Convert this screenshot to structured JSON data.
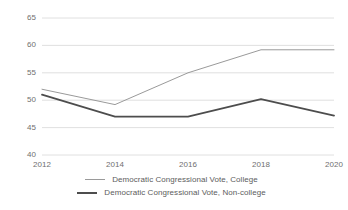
{
  "chart_data": {
    "type": "line",
    "title": "",
    "subtitle": "",
    "xlabel": "",
    "ylabel": "",
    "categories": [
      "2012",
      "2014",
      "2016",
      "2018",
      "2020"
    ],
    "x": [
      2012,
      2014,
      2016,
      2018,
      2020
    ],
    "xlim": [
      2012,
      2020
    ],
    "ylim": [
      40,
      65
    ],
    "yticks": [
      40,
      45,
      50,
      55,
      60,
      65
    ],
    "ytick_labels": [
      "40",
      "45",
      "50",
      "55",
      "60",
      "65"
    ],
    "xticks": [
      2012,
      2014,
      2016,
      2018,
      2020
    ],
    "xtick_labels": [
      "2012",
      "2014",
      "2016",
      "2018",
      "2020"
    ],
    "grid": "horizontal",
    "legend_position": "bottom",
    "series": [
      {
        "name": "Democratic Congressional Vote, College",
        "color": "#9a9a9a",
        "width": 1,
        "values": [
          52.0,
          49.2,
          55.0,
          59.2,
          59.2
        ]
      },
      {
        "name": "Democratic Congressional Vote, Non-college",
        "color": "#4d4d4d",
        "width": 1.8,
        "values": [
          51.0,
          47.0,
          47.0,
          50.2,
          47.2
        ]
      }
    ]
  },
  "colors": {
    "background": "#ffffff",
    "grid": "#d8d8d8",
    "axis_text": "#6f6f6f",
    "legend_text": "#5c5c5c",
    "series_college": "#9a9a9a",
    "series_noncollege": "#4d4d4d"
  },
  "legend": {
    "items": [
      {
        "label": "Democratic Congressional Vote, College"
      },
      {
        "label": "Democratic Congressional Vote, Non-college"
      }
    ]
  }
}
